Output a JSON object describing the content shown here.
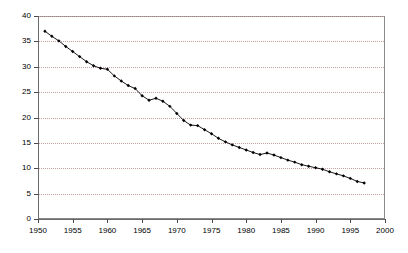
{
  "chart_data": {
    "type": "line",
    "title": "",
    "xlabel": "",
    "ylabel": "",
    "xlim": [
      1950,
      2000
    ],
    "ylim": [
      0,
      40
    ],
    "xticks": [
      1950,
      1955,
      1960,
      1965,
      1970,
      1975,
      1980,
      1985,
      1990,
      1995,
      2000
    ],
    "yticks": [
      0,
      5,
      10,
      15,
      20,
      25,
      30,
      35,
      40
    ],
    "grid": "horizontal-dotted",
    "legend": "none",
    "marker": "filled-diamond",
    "line_color": "#000000",
    "marker_color": "#000000",
    "grid_color": "#c9a0a0",
    "frame_color": "#8a8a8a",
    "x": [
      1951,
      1952,
      1953,
      1954,
      1955,
      1956,
      1957,
      1958,
      1959,
      1960,
      1961,
      1962,
      1963,
      1964,
      1965,
      1966,
      1967,
      1968,
      1969,
      1970,
      1971,
      1972,
      1973,
      1974,
      1975,
      1976,
      1977,
      1978,
      1979,
      1980,
      1981,
      1982,
      1983,
      1984,
      1985,
      1986,
      1987,
      1988,
      1989,
      1990,
      1991,
      1992,
      1993,
      1994,
      1995,
      1996,
      1997
    ],
    "values": [
      37.0,
      36.0,
      35.1,
      34.0,
      33.0,
      32.0,
      31.0,
      30.2,
      29.7,
      29.5,
      28.2,
      27.2,
      26.3,
      25.7,
      24.3,
      23.4,
      23.8,
      23.2,
      22.2,
      20.8,
      19.4,
      18.5,
      18.4,
      17.6,
      16.8,
      15.9,
      15.2,
      14.6,
      14.1,
      13.6,
      13.1,
      12.7,
      13.0,
      12.6,
      12.1,
      11.6,
      11.2,
      10.7,
      10.4,
      10.1,
      9.8,
      9.3,
      8.9,
      8.5,
      8.0,
      7.4,
      7.1
    ]
  }
}
